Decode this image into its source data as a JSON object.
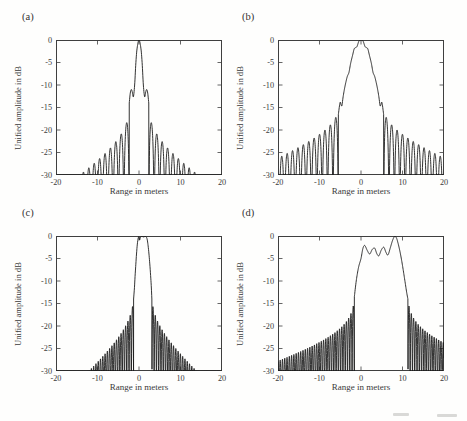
{
  "colors": {
    "curve": "#1c1c1c",
    "axis": "#3f3f3f",
    "text": "#3a3a3a",
    "background": "#fefefd"
  },
  "chart_data": [
    {
      "type": "line",
      "title": "(a)",
      "xlabel": "Range in meters",
      "ylabel": "Unified amplitude in dB",
      "xlim": [
        -20,
        20
      ],
      "ylim": [
        -30,
        0
      ],
      "xticks": [
        -20,
        -10,
        0,
        10,
        20
      ],
      "yticks": [
        0,
        -5,
        -10,
        -15,
        -20,
        -25,
        -30
      ],
      "grid": false,
      "legend": null,
      "series": [
        {
          "name": "compressed-range-profile",
          "peak_db": 0,
          "mainlobe_anchors_m_db": [
            [
              -2.35,
              -14
            ],
            [
              -2.1,
              -11.8
            ],
            [
              -1.85,
              -11
            ],
            [
              -1.6,
              -11.6
            ],
            [
              -1.35,
              -12.6
            ],
            [
              -1.05,
              -10
            ],
            [
              -0.75,
              -5
            ],
            [
              -0.45,
              -1.8
            ],
            [
              0,
              0
            ],
            [
              0.45,
              -1.8
            ],
            [
              0.75,
              -5
            ],
            [
              1.05,
              -10
            ],
            [
              1.35,
              -12.6
            ],
            [
              1.6,
              -11.6
            ],
            [
              1.85,
              -11
            ],
            [
              2.1,
              -11.8
            ],
            [
              2.35,
              -14
            ]
          ],
          "sidelobes": {
            "period_m": 1.3,
            "first_peak_db": -16.3,
            "log_decay": 0.3,
            "linear_decay_db_per_m": 0.5,
            "clip_floor_db": -30
          }
        }
      ]
    },
    {
      "type": "line",
      "title": "(b)",
      "xlabel": "Range in meters",
      "ylabel": "Unified amplitude in dB",
      "xlim": [
        -20,
        20
      ],
      "ylim": [
        -30,
        0
      ],
      "xticks": [
        -20,
        -10,
        0,
        10,
        20
      ],
      "yticks": [
        0,
        -5,
        -10,
        -15,
        -20,
        -25,
        -30
      ],
      "grid": false,
      "legend": null,
      "series": [
        {
          "name": "compressed-range-profile",
          "peak_db": 0,
          "mainlobe_anchors_m_db": [
            [
              -5.45,
              -16.5
            ],
            [
              -5.05,
              -13.9
            ],
            [
              -4.8,
              -14.4
            ],
            [
              -4.6,
              -14.6
            ],
            [
              -4.35,
              -12.9
            ],
            [
              -4.05,
              -11.2
            ],
            [
              -3.7,
              -9.6
            ],
            [
              -3.3,
              -8.1
            ],
            [
              -2.9,
              -7.2
            ],
            [
              -2.5,
              -5.2
            ],
            [
              -2.0,
              -3.3
            ],
            [
              -1.6,
              -1.9
            ],
            [
              -1.0,
              -1.5
            ],
            [
              -0.5,
              -0.25
            ],
            [
              0,
              0
            ],
            [
              0.5,
              -0.25
            ],
            [
              1.0,
              -1.5
            ],
            [
              1.6,
              -1.9
            ],
            [
              2.0,
              -3.3
            ],
            [
              2.5,
              -5.2
            ],
            [
              2.9,
              -7.2
            ],
            [
              3.3,
              -8.1
            ],
            [
              3.7,
              -9.6
            ],
            [
              4.05,
              -11.2
            ],
            [
              4.35,
              -12.9
            ],
            [
              4.6,
              -14.6
            ],
            [
              4.8,
              -14.4
            ],
            [
              5.05,
              -13.9
            ],
            [
              5.45,
              -16.5
            ]
          ],
          "sidelobes": {
            "period_m": 1.3,
            "first_peak_db": -15.8,
            "log_decay": 0.2,
            "linear_decay_db_per_m": 0.34,
            "clip_floor_db": -30
          }
        }
      ]
    },
    {
      "type": "line",
      "title": "(c)",
      "xlabel": "Range in meters",
      "ylabel": "Unified amplitude in dB",
      "xlim": [
        -20,
        20
      ],
      "ylim": [
        -30,
        0
      ],
      "xticks": [
        -20,
        -10,
        0,
        10,
        20
      ],
      "yticks": [
        0,
        -5,
        -10,
        -15,
        -20,
        -25,
        -30
      ],
      "grid": false,
      "legend": null,
      "series": [
        {
          "name": "compressed-range-profile",
          "peak_db": 0,
          "mainlobe_anchors_m_db": [
            [
              -1.3,
              -14
            ],
            [
              -1.1,
              -11.5
            ],
            [
              -0.95,
              -9
            ],
            [
              -0.8,
              -6.8
            ],
            [
              -0.6,
              -4
            ],
            [
              -0.4,
              -1.8
            ],
            [
              -0.2,
              -0.5
            ],
            [
              0,
              -0.15
            ],
            [
              0.15,
              -0.9
            ],
            [
              0.35,
              -0.25
            ],
            [
              0.7,
              -0.1
            ],
            [
              1.1,
              -0.2
            ],
            [
              1.5,
              -0.1
            ],
            [
              1.8,
              -0.3
            ],
            [
              2.0,
              -0.9
            ],
            [
              2.2,
              -2.2
            ],
            [
              2.4,
              -4
            ],
            [
              2.6,
              -6.2
            ],
            [
              2.8,
              -8.8
            ],
            [
              2.95,
              -11
            ],
            [
              3.1,
              -14
            ]
          ],
          "sidelobes": {
            "period_m": 0.55,
            "first_peak_db": -14,
            "log_decay": 0.25,
            "linear_decay_db_per_m": 0.74,
            "clip_floor_db": -30
          }
        }
      ]
    },
    {
      "type": "line",
      "title": "(d)",
      "xlabel": "Range in meters",
      "ylabel": "Unified amplitude in dB",
      "xlim": [
        -20,
        20
      ],
      "ylim": [
        -30,
        0
      ],
      "xticks": [
        -20,
        -10,
        0,
        10,
        20
      ],
      "yticks": [
        0,
        -5,
        -10,
        -15,
        -20,
        -25,
        -30
      ],
      "grid": false,
      "legend": null,
      "series": [
        {
          "name": "compressed-range-profile",
          "peak_db": 0,
          "mainlobe_anchors_m_db": [
            [
              -1.6,
              -13.5
            ],
            [
              -1.15,
              -10
            ],
            [
              -0.6,
              -7
            ],
            [
              0,
              -5
            ],
            [
              0.45,
              -2.8
            ],
            [
              0.9,
              -2.1
            ],
            [
              1.5,
              -3.2
            ],
            [
              2.1,
              -4.0
            ],
            [
              2.7,
              -3.0
            ],
            [
              3.3,
              -2.7
            ],
            [
              3.8,
              -3.9
            ],
            [
              4.3,
              -4.4
            ],
            [
              4.9,
              -3.1
            ],
            [
              5.5,
              -2.5
            ],
            [
              6.0,
              -3.6
            ],
            [
              6.5,
              -4.2
            ],
            [
              7.1,
              -2.5
            ],
            [
              7.6,
              -1.0
            ],
            [
              8.05,
              -0.15
            ],
            [
              8.5,
              -0.35
            ],
            [
              8.9,
              -1.5
            ],
            [
              9.4,
              -3.5
            ],
            [
              9.9,
              -6
            ],
            [
              10.5,
              -9.5
            ],
            [
              11.0,
              -12.5
            ],
            [
              11.3,
              -14
            ]
          ],
          "sidelobes": {
            "period_m": 0.55,
            "first_peak_db": -14,
            "log_decay": 0.25,
            "linear_decay_db_per_m": 0.25,
            "clip_floor_db": -30
          }
        }
      ]
    }
  ]
}
